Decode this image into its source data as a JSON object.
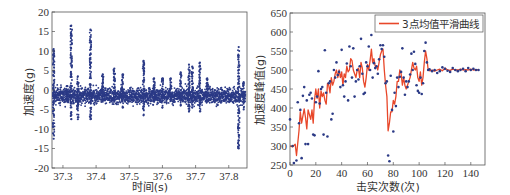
{
  "chart_data": [
    {
      "type": "scatter",
      "title": "",
      "xlabel": "时间(s)",
      "ylabel": "加速度(g)",
      "xlim": [
        37.267,
        37.855
      ],
      "ylim": [
        -20,
        20
      ],
      "xticks": [
        37.3,
        37.4,
        37.5,
        37.6,
        37.7,
        37.8
      ],
      "xtick_labels": [
        "37.3",
        "37.4",
        "37.5",
        "37.6",
        "37.7",
        "37.8"
      ],
      "yticks": [
        -20,
        -15,
        -10,
        -5,
        0,
        5,
        10,
        15,
        20
      ],
      "ytick_labels": [
        "-20",
        "-15",
        "-10",
        "-5",
        "0",
        "5",
        "10",
        "15",
        "20"
      ],
      "grid": false,
      "marker_color": "#2b3a86",
      "baseline": -1.5,
      "bursts": [
        {
          "t": 37.272,
          "max": 10.5,
          "min": -12.5
        },
        {
          "t": 37.313,
          "max": 1.0,
          "min": -3.0
        },
        {
          "t": 37.325,
          "max": 16.5,
          "min": -7.5
        },
        {
          "t": 37.345,
          "max": 3.5,
          "min": -7.5
        },
        {
          "t": 37.383,
          "max": 15.5,
          "min": -7.5
        },
        {
          "t": 37.42,
          "max": 4.0,
          "min": -3.0
        },
        {
          "t": 37.455,
          "max": 5.5,
          "min": -3.0
        },
        {
          "t": 37.48,
          "max": 4.0,
          "min": -4.5
        },
        {
          "t": 37.543,
          "max": 7.5,
          "min": -6.5
        },
        {
          "t": 37.575,
          "max": 3.0,
          "min": -3.0
        },
        {
          "t": 37.6,
          "max": 3.0,
          "min": -4.5
        },
        {
          "t": 37.625,
          "max": 3.0,
          "min": -2.5
        },
        {
          "t": 37.655,
          "max": 4.5,
          "min": -4.0
        },
        {
          "t": 37.68,
          "max": 6.5,
          "min": -5.5
        },
        {
          "t": 37.69,
          "max": 6.0,
          "min": -4.5
        },
        {
          "t": 37.713,
          "max": 7.0,
          "min": -5.5
        },
        {
          "t": 37.735,
          "max": 3.0,
          "min": -3.0
        },
        {
          "t": 37.83,
          "max": 11.0,
          "min": -15.0
        },
        {
          "t": 37.845,
          "max": 2.0,
          "min": -5.0
        }
      ]
    },
    {
      "type": "line",
      "title": "",
      "xlabel": "击实次数(次)",
      "ylabel": "加速度峰值(g)",
      "xlim": [
        0,
        151
      ],
      "ylim": [
        250,
        650
      ],
      "xticks": [
        0,
        20,
        40,
        60,
        80,
        100,
        120,
        140
      ],
      "xtick_labels": [
        "0",
        "20",
        "40",
        "60",
        "80",
        "100",
        "120",
        "140"
      ],
      "yticks": [
        250,
        300,
        350,
        400,
        450,
        500,
        550,
        600,
        650
      ],
      "ytick_labels": [
        "250",
        "300",
        "350",
        "400",
        "450",
        "500",
        "550",
        "600",
        "650"
      ],
      "grid": false,
      "legend": {
        "position": "upper right",
        "entries": [
          "3点均值平滑曲线"
        ]
      },
      "series": [
        {
          "name": "加速度峰值",
          "kind": "scatter",
          "color": "#2b3a86",
          "x": [
            0,
            2,
            3,
            5,
            6,
            7,
            8,
            9,
            10,
            11,
            12,
            13,
            14,
            15,
            16,
            17,
            18,
            19,
            20,
            21,
            22,
            23,
            24,
            25,
            26,
            27,
            28,
            29,
            30,
            31,
            32,
            33,
            34,
            35,
            36,
            37,
            38,
            39,
            40,
            41,
            42,
            43,
            44,
            45,
            46,
            47,
            48,
            49,
            50,
            51,
            52,
            53,
            54,
            55,
            56,
            57,
            58,
            59,
            60,
            61,
            62,
            63,
            64,
            65,
            66,
            67,
            68,
            69,
            70,
            71,
            72,
            73,
            74,
            75,
            76,
            77,
            78,
            79,
            80,
            81,
            82,
            83,
            84,
            85,
            86,
            87,
            88,
            89,
            90,
            91,
            92,
            93,
            94,
            95,
            96,
            97,
            98,
            99,
            100,
            101,
            102,
            103,
            104,
            105,
            106,
            107,
            108,
            110,
            112,
            114,
            116,
            118,
            120,
            122,
            124,
            126,
            128,
            130,
            132,
            134,
            136,
            138,
            140,
            142,
            144,
            146
          ],
          "y": [
            370,
            300,
            255,
            262,
            415,
            360,
            395,
            268,
            432,
            455,
            305,
            420,
            305,
            435,
            440,
            425,
            330,
            328,
            415,
            430,
            497,
            412,
            450,
            455,
            330,
            552,
            440,
            325,
            465,
            470,
            370,
            385,
            500,
            480,
            520,
            487,
            495,
            455,
            553,
            460,
            430,
            470,
            517,
            420,
            562,
            510,
            480,
            557,
            430,
            470,
            500,
            475,
            510,
            582,
            490,
            437,
            440,
            520,
            510,
            562,
            500,
            592,
            480,
            518,
            505,
            510,
            490,
            528,
            565,
            555,
            565,
            535,
            465,
            470,
            275,
            260,
            485,
            395,
            338,
            440,
            405,
            480,
            455,
            482,
            495,
            557,
            480,
            435,
            470,
            455,
            470,
            488,
            543,
            500,
            548,
            516,
            460,
            445,
            440,
            480,
            437,
            465,
            550,
            572,
            520,
            500,
            502,
            497,
            500,
            492,
            497,
            507,
            503,
            498,
            495,
            505,
            500,
            497,
            500,
            503,
            497,
            505,
            500,
            503,
            500,
            500
          ]
        },
        {
          "name": "3点均值平滑曲线",
          "kind": "line",
          "color": "#e8472a",
          "x": [
            0,
            2,
            4,
            5,
            7,
            8,
            9,
            11,
            12,
            13,
            14,
            16,
            17,
            18,
            19,
            20,
            21,
            22,
            23,
            24,
            25,
            26,
            27,
            28,
            29,
            30,
            31,
            32,
            33,
            34,
            35,
            36,
            37,
            38,
            39,
            40,
            41,
            42,
            43,
            44,
            45,
            46,
            47,
            48,
            49,
            50,
            51,
            52,
            53,
            54,
            55,
            56,
            57,
            58,
            59,
            60,
            61,
            62,
            63,
            64,
            65,
            66,
            67,
            68,
            69,
            70,
            71,
            72,
            73,
            74,
            75,
            76,
            77,
            78,
            79,
            80,
            81,
            82,
            83,
            84,
            85,
            86,
            87,
            88,
            89,
            90,
            91,
            92,
            93,
            94,
            95,
            96,
            97,
            98,
            99,
            100,
            101,
            102,
            103,
            104,
            105,
            106,
            107,
            108,
            110,
            112,
            114,
            116,
            118,
            120,
            122,
            124,
            126,
            128,
            130,
            132,
            134,
            136,
            138,
            140,
            142,
            144,
            146
          ],
          "y": [
            300,
            298,
            305,
            275,
            340,
            390,
            360,
            398,
            375,
            345,
            395,
            370,
            395,
            360,
            420,
            450,
            425,
            450,
            400,
            445,
            430,
            440,
            420,
            410,
            465,
            460,
            440,
            480,
            460,
            470,
            490,
            500,
            480,
            500,
            480,
            495,
            460,
            490,
            480,
            510,
            495,
            500,
            530,
            525,
            500,
            490,
            480,
            500,
            505,
            480,
            520,
            505,
            470,
            455,
            480,
            515,
            500,
            525,
            555,
            520,
            530,
            510,
            510,
            500,
            520,
            540,
            550,
            555,
            500,
            460,
            430,
            340,
            360,
            390,
            390,
            420,
            410,
            430,
            470,
            470,
            500,
            490,
            460,
            480,
            460,
            450,
            460,
            470,
            480,
            500,
            520,
            505,
            500,
            510,
            480,
            470,
            495,
            460,
            480,
            520,
            550,
            530,
            500,
            498,
            500,
            497,
            500,
            502,
            498,
            505,
            500,
            499,
            502,
            500,
            500,
            502,
            500,
            501,
            500,
            502,
            500,
            501,
            500
          ]
        }
      ]
    }
  ],
  "left_chart": {
    "xlabel": "时间(s)",
    "ylabel": "加速度(g)",
    "xtick_labels": [
      "37.3",
      "37.4",
      "37.5",
      "37.6",
      "37.7",
      "37.8"
    ],
    "ytick_labels": [
      "20",
      "15",
      "10",
      "5",
      "0",
      "-5",
      "-10",
      "-15",
      "-20"
    ]
  },
  "right_chart": {
    "xlabel": "击实次数(次)",
    "ylabel": "加速度峰值(g)",
    "xtick_labels": [
      "0",
      "20",
      "40",
      "60",
      "80",
      "100",
      "120",
      "140"
    ],
    "ytick_labels": [
      "650",
      "600",
      "550",
      "500",
      "450",
      "400",
      "350",
      "300",
      "250"
    ],
    "legend_label": "3点均值平滑曲线"
  }
}
